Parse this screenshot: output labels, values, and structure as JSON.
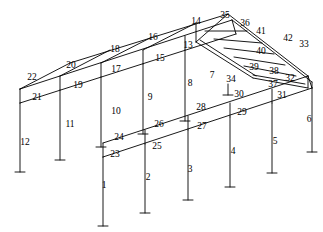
{
  "figure": {
    "type": "isometric-line-diagram",
    "width": 323,
    "height": 232,
    "stroke_color": "#000000",
    "background_color": "#ffffff",
    "line_width": 0.9
  },
  "labels": [
    {
      "id": "m1",
      "text": "1",
      "x": 104,
      "y": 186
    },
    {
      "id": "m2",
      "text": "2",
      "x": 148,
      "y": 178
    },
    {
      "id": "m3",
      "text": "3",
      "x": 190,
      "y": 170
    },
    {
      "id": "m4",
      "text": "4",
      "x": 233,
      "y": 152
    },
    {
      "id": "m5",
      "text": "5",
      "x": 275,
      "y": 142
    },
    {
      "id": "m6",
      "text": "6",
      "x": 309,
      "y": 120
    },
    {
      "id": "m7",
      "text": "7",
      "x": 212,
      "y": 76
    },
    {
      "id": "m8",
      "text": "8",
      "x": 190,
      "y": 84
    },
    {
      "id": "m9",
      "text": "9",
      "x": 150,
      "y": 98
    },
    {
      "id": "m10",
      "text": "10",
      "x": 116,
      "y": 112
    },
    {
      "id": "m11",
      "text": "11",
      "x": 70,
      "y": 125
    },
    {
      "id": "m12",
      "text": "12",
      "x": 25,
      "y": 143
    },
    {
      "id": "m13",
      "text": "13",
      "x": 188,
      "y": 46
    },
    {
      "id": "m14",
      "text": "14",
      "x": 196,
      "y": 22
    },
    {
      "id": "m15",
      "text": "15",
      "x": 160,
      "y": 59
    },
    {
      "id": "m16",
      "text": "16",
      "x": 153,
      "y": 38
    },
    {
      "id": "m17",
      "text": "17",
      "x": 116,
      "y": 70
    },
    {
      "id": "m18",
      "text": "18",
      "x": 115,
      "y": 50
    },
    {
      "id": "m19",
      "text": "19",
      "x": 78,
      "y": 86
    },
    {
      "id": "m20",
      "text": "20",
      "x": 71,
      "y": 66
    },
    {
      "id": "m21",
      "text": "21",
      "x": 37,
      "y": 98
    },
    {
      "id": "m22",
      "text": "22",
      "x": 32,
      "y": 78
    },
    {
      "id": "m23",
      "text": "23",
      "x": 115,
      "y": 155
    },
    {
      "id": "m24",
      "text": "24",
      "x": 119,
      "y": 138
    },
    {
      "id": "m25",
      "text": "25",
      "x": 157,
      "y": 147
    },
    {
      "id": "m26",
      "text": "26",
      "x": 159,
      "y": 125
    },
    {
      "id": "m27",
      "text": "27",
      "x": 202,
      "y": 127
    },
    {
      "id": "m28",
      "text": "28",
      "x": 201,
      "y": 108
    },
    {
      "id": "m29",
      "text": "29",
      "x": 242,
      "y": 113
    },
    {
      "id": "m30",
      "text": "30",
      "x": 239,
      "y": 95
    },
    {
      "id": "m31",
      "text": "31",
      "x": 282,
      "y": 96
    },
    {
      "id": "m32",
      "text": "32",
      "x": 290,
      "y": 79
    },
    {
      "id": "m33",
      "text": "33",
      "x": 304,
      "y": 45
    },
    {
      "id": "m34",
      "text": "34",
      "x": 231,
      "y": 80
    },
    {
      "id": "m35",
      "text": "35",
      "x": 225,
      "y": 16
    },
    {
      "id": "m36",
      "text": "36",
      "x": 245,
      "y": 24
    },
    {
      "id": "m37",
      "text": "37",
      "x": 273,
      "y": 85
    },
    {
      "id": "m38",
      "text": "38",
      "x": 274,
      "y": 72
    },
    {
      "id": "m39",
      "text": "39",
      "x": 254,
      "y": 68
    },
    {
      "id": "m40",
      "text": "40",
      "x": 261,
      "y": 52
    },
    {
      "id": "m41",
      "text": "41",
      "x": 261,
      "y": 32
    },
    {
      "id": "m42",
      "text": "42",
      "x": 288,
      "y": 39
    }
  ],
  "geometry": {
    "back_eave_line": {
      "from_x": 20,
      "from_y": 103,
      "to_x": 236,
      "to_y": 34
    },
    "back_top_line": {
      "from_x": 20,
      "from_y": 89,
      "to_x": 232,
      "to_y": 20
    },
    "front_eave_line": {
      "from_x": 103,
      "from_y": 157,
      "to_x": 312,
      "to_y": 88
    },
    "front_top_line": {
      "from_x": 103,
      "from_y": 143,
      "to_x": 308,
      "to_y": 76
    },
    "ridge_line": {
      "from_x": 70,
      "from_y": 63,
      "to_x": 228,
      "to_y": 14
    },
    "hip_start_node": {
      "x": 196,
      "y": 42
    },
    "hip_end_node": {
      "x": 253,
      "y": 78
    },
    "back_columns_x": [
      20,
      60,
      101,
      143,
      185
    ],
    "front_columns_x": [
      103,
      145,
      188,
      230,
      272,
      312
    ]
  }
}
